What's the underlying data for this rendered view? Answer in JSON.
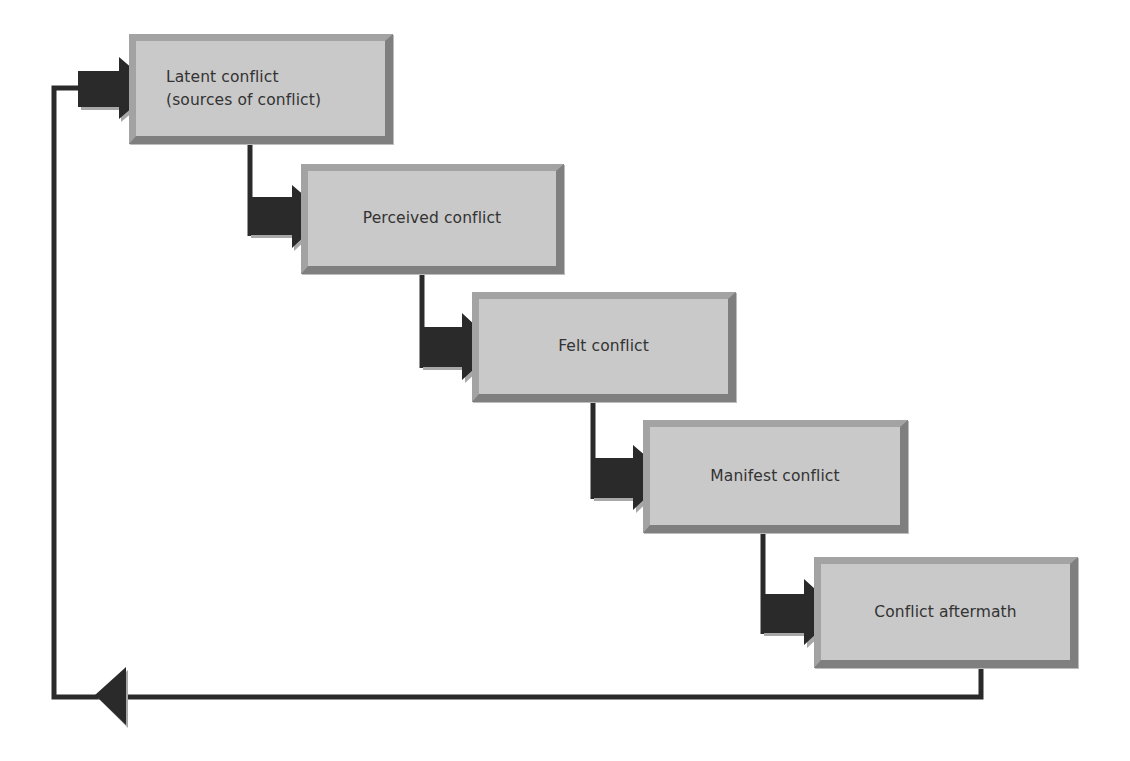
{
  "diagram": {
    "type": "conflict-process-flow",
    "stages": [
      {
        "id": "latent",
        "label_line1": "Latent conflict",
        "label_line2": "(sources of conflict)"
      },
      {
        "id": "perceived",
        "label": "Perceived conflict"
      },
      {
        "id": "felt",
        "label": "Felt conflict"
      },
      {
        "id": "manifest",
        "label": "Manifest conflict"
      },
      {
        "id": "aftermath",
        "label": "Conflict aftermath"
      }
    ],
    "edges": [
      {
        "from": "latent",
        "to": "perceived"
      },
      {
        "from": "perceived",
        "to": "felt"
      },
      {
        "from": "felt",
        "to": "manifest"
      },
      {
        "from": "manifest",
        "to": "aftermath"
      },
      {
        "from": "aftermath",
        "to": "latent",
        "kind": "feedback-loop"
      }
    ],
    "colors": {
      "box_fill": "#c9c9c9",
      "box_border_light": "#a3a3a3",
      "box_border_dark": "#7f7f7f",
      "arrow": "#2a2a2a",
      "arrow_shadow": "#9a9a9a",
      "line": "#2a2a2a",
      "text": "#333333"
    }
  }
}
